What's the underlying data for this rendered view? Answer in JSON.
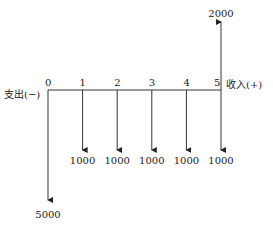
{
  "diagram": {
    "type": "cash-flow",
    "outflow_label": "支出(−)",
    "inflow_label": "收入(+)",
    "periods": [
      "0",
      "1",
      "2",
      "3",
      "4",
      "5"
    ],
    "flows": [
      {
        "period": 0,
        "direction": "out",
        "amount": "5000"
      },
      {
        "period": 1,
        "direction": "out",
        "amount": "1000"
      },
      {
        "period": 2,
        "direction": "out",
        "amount": "1000"
      },
      {
        "period": 3,
        "direction": "out",
        "amount": "1000"
      },
      {
        "period": 4,
        "direction": "out",
        "amount": "1000"
      },
      {
        "period": 5,
        "direction": "out",
        "amount": "1000"
      },
      {
        "period": 5,
        "direction": "in",
        "amount": "2000"
      }
    ]
  }
}
